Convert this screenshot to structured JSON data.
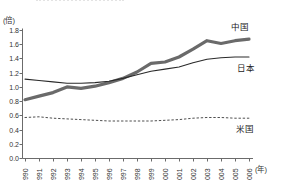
{
  "page": {
    "background": "#ffffff"
  },
  "chart_data": {
    "type": "line",
    "title": "",
    "y_unit_label": "(倍)",
    "x_unit_label": "(年)",
    "x_tick_labels": [
      "1990",
      "1991",
      "1992",
      "1993",
      "1994",
      "1995",
      "1996",
      "1997",
      "1998",
      "1999",
      "2000",
      "2001",
      "2002",
      "2003",
      "2004",
      "2005",
      "2006"
    ],
    "y_ticks": [
      0.0,
      0.2,
      0.4,
      0.6,
      0.8,
      1.0,
      1.2,
      1.4,
      1.6,
      1.8
    ],
    "ylim": [
      0.0,
      1.8
    ],
    "grid": false,
    "legend_position": "inline-right-of-lines",
    "series": [
      {
        "name": "中国",
        "style": "thick-solid",
        "color": "#6a6a6a",
        "values": [
          0.82,
          0.87,
          0.92,
          1.0,
          0.98,
          1.01,
          1.06,
          1.12,
          1.21,
          1.33,
          1.35,
          1.42,
          1.53,
          1.65,
          1.61,
          1.65,
          1.67
        ]
      },
      {
        "name": "日本",
        "style": "thin-solid",
        "color": "#2a2a2a",
        "values": [
          1.11,
          1.09,
          1.07,
          1.05,
          1.05,
          1.06,
          1.08,
          1.12,
          1.17,
          1.22,
          1.25,
          1.28,
          1.34,
          1.39,
          1.41,
          1.42,
          1.42
        ]
      },
      {
        "name": "米国",
        "style": "dotted",
        "color": "#4f4f4f",
        "values": [
          0.57,
          0.58,
          0.56,
          0.55,
          0.54,
          0.53,
          0.52,
          0.52,
          0.52,
          0.52,
          0.53,
          0.54,
          0.56,
          0.57,
          0.57,
          0.56,
          0.56
        ]
      }
    ],
    "colors": {
      "axis": "#6b6b6b",
      "tick_text": "#333333"
    }
  }
}
